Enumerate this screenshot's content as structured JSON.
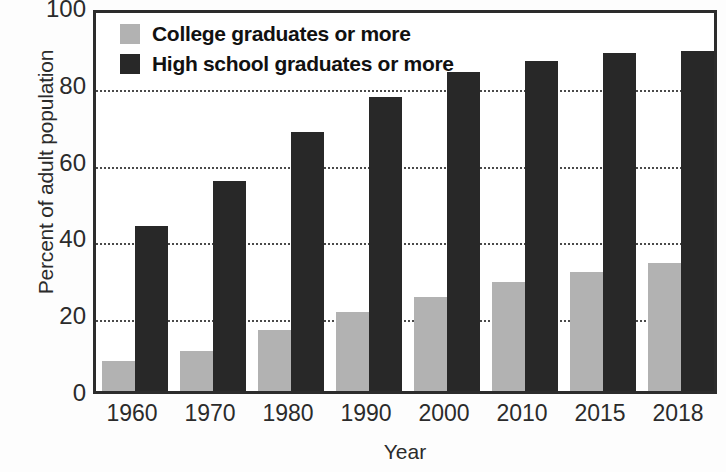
{
  "chart_data": {
    "type": "bar",
    "title": "",
    "subtitle": "",
    "xlabel": "Year",
    "ylabel": "Percent of adult population",
    "categories": [
      "1960",
      "1970",
      "1980",
      "1990",
      "2000",
      "2010",
      "2015",
      "2018"
    ],
    "series": [
      {
        "name": "College graduates or more",
        "color": "#b2b2b2",
        "values": [
          7.9,
          10.5,
          16.0,
          20.5,
          24.5,
          28.5,
          31.0,
          33.4
        ]
      },
      {
        "name": "High school graduates or more",
        "color": "#282828",
        "values": [
          43.0,
          54.7,
          67.5,
          76.5,
          83.0,
          86.0,
          88.0,
          88.5
        ]
      }
    ],
    "ylim": [
      0,
      100
    ],
    "yticks": [
      0,
      20,
      40,
      60,
      80,
      100
    ],
    "ytick_labels": [
      "0",
      "20",
      "40",
      "60",
      "80",
      "100"
    ],
    "grid": true,
    "grid_style": "dotted-horizontal",
    "legend_position": "top-left",
    "axes_frame": true
  },
  "legend": {
    "items": [
      {
        "label": "College graduates or more",
        "swatch": "college"
      },
      {
        "label": "High school graduates or more",
        "swatch": "highschool"
      }
    ]
  },
  "colors": {
    "college": "#b2b2b2",
    "highschool": "#282828",
    "axis": "#2c2c2c",
    "grid": "#4a4a4a",
    "text": "#2b2b2b",
    "background": "#ffffff"
  }
}
